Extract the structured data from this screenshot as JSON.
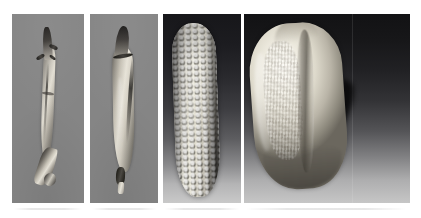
{
  "figure": {
    "background_color": "#ffffff",
    "width": 421,
    "height": 218,
    "panel_count": 4,
    "caption": "",
    "panels": [
      {
        "id": "panel-1",
        "subject": "teosinte-ear-husked",
        "description": "Slender husked teosinte ear with dark glume bracts, photographed vertically on a flat gray studio background",
        "background_style": "flat-gray",
        "background_color": "#858585",
        "x": 12,
        "y": 14,
        "width": 72,
        "height": 189,
        "specimen_color_light": "#e2ded3",
        "specimen_color_dark": "#1d1b19"
      },
      {
        "id": "panel-2",
        "subject": "maize-teosinte-intermediate-ear",
        "description": "Broader husked ear with a dark encircling band near the tip and a pale exposed stalk at the base, on flat gray background",
        "background_style": "flat-gray",
        "background_color": "#858585",
        "x": 90,
        "y": 14,
        "width": 68,
        "height": 189,
        "specimen_color_light": "#e6e2d7",
        "specimen_color_dark": "#151413"
      },
      {
        "id": "panel-3",
        "subject": "maize-ear-kernel-rows",
        "description": "Mature maize ear showing regular longitudinal rows of pale kernels, lit from the left against a dark-to-light gradient backdrop with a cast shadow to the right",
        "background_style": "vertical-gradient-dark-to-light",
        "background_top_color": "#17171a",
        "background_bottom_color": "#c9c9c9",
        "x": 163,
        "y": 14,
        "width": 78,
        "height": 189,
        "specimen_color_light": "#eceade",
        "specimen_color_dark": "#4b4945"
      },
      {
        "id": "panel-4",
        "subject": "maize-kernel-single",
        "description": "Single maize kernel at high magnification showing the dented crown, the central crease and wrinkled endosperm surface, with a hard cast shadow falling to the lower right",
        "background_style": "vertical-gradient-dark-to-light",
        "background_top_color": "#121214",
        "background_bottom_color": "#c6c6c6",
        "x": 244,
        "y": 14,
        "width": 166,
        "height": 189,
        "specimen_color_light": "#fbf9f2",
        "specimen_color_dark": "#6b675e",
        "shadow_color": "#0b0b0c"
      }
    ],
    "artifact": {
      "description": "faint horizontal scan artifact beneath the plate",
      "y": 208,
      "segments": [
        {
          "x": 14,
          "width": 68
        },
        {
          "x": 92,
          "width": 64
        },
        {
          "x": 165,
          "width": 74
        },
        {
          "x": 246,
          "width": 160
        }
      ]
    }
  }
}
